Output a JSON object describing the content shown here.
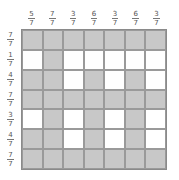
{
  "puzzle": {
    "size": 7,
    "fill_color": "#c8c8c8",
    "empty_color": "#ffffff",
    "column_clues": [
      {
        "num": "5",
        "den": "7"
      },
      {
        "num": "7",
        "den": "7"
      },
      {
        "num": "3",
        "den": "7"
      },
      {
        "num": "6",
        "den": "7"
      },
      {
        "num": "3",
        "den": "7"
      },
      {
        "num": "6",
        "den": "7"
      },
      {
        "num": "3",
        "den": "7"
      }
    ],
    "row_clues": [
      {
        "num": "7",
        "den": "7"
      },
      {
        "num": "1",
        "den": "7"
      },
      {
        "num": "4",
        "den": "7"
      },
      {
        "num": "7",
        "den": "7"
      },
      {
        "num": "3",
        "den": "7"
      },
      {
        "num": "4",
        "den": "7"
      },
      {
        "num": "7",
        "den": "7"
      }
    ],
    "cells": [
      [
        1,
        1,
        1,
        1,
        1,
        1,
        1
      ],
      [
        0,
        1,
        0,
        0,
        0,
        0,
        0
      ],
      [
        1,
        1,
        0,
        1,
        0,
        1,
        0
      ],
      [
        1,
        1,
        1,
        1,
        1,
        1,
        1
      ],
      [
        0,
        1,
        0,
        1,
        0,
        1,
        0
      ],
      [
        1,
        1,
        0,
        1,
        0,
        1,
        0
      ],
      [
        1,
        1,
        1,
        1,
        1,
        1,
        1
      ]
    ]
  }
}
